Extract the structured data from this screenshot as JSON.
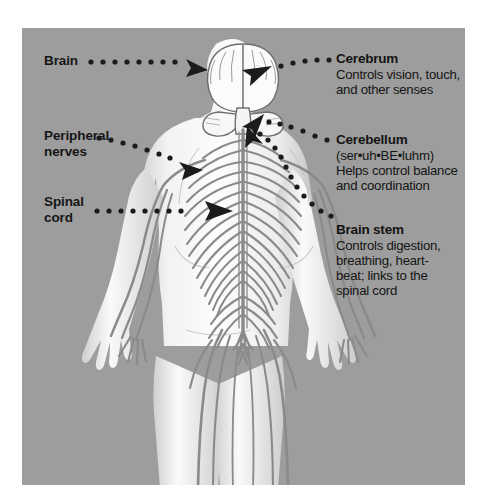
{
  "figure": {
    "panel_color": "#9d9d9d",
    "nerve_color": "#8a8a8a",
    "body_color": "#fbfbfb",
    "leader_color": "#1b1b1b",
    "left_labels": [
      {
        "id": "brain",
        "text": "Brain"
      },
      {
        "id": "peripheral-nerves",
        "line1": "Peripheral",
        "line2": "nerves"
      },
      {
        "id": "spinal-cord",
        "line1": "Spinal",
        "line2": "cord"
      }
    ],
    "right_blocks": [
      {
        "id": "cerebrum",
        "heading": "Cerebrum",
        "lines": [
          "Controls vision, touch,",
          "and other senses"
        ]
      },
      {
        "id": "cerebellum",
        "heading": "Cerebellum",
        "lines": [
          "(ser•uh•BE•luhm)",
          "Helps control balance",
          "and coordination"
        ]
      },
      {
        "id": "brain-stem",
        "heading": "Brain stem",
        "lines": [
          "Controls digestion,",
          "breathing, heart-",
          "beat; links to the",
          "spinal cord"
        ]
      }
    ]
  }
}
